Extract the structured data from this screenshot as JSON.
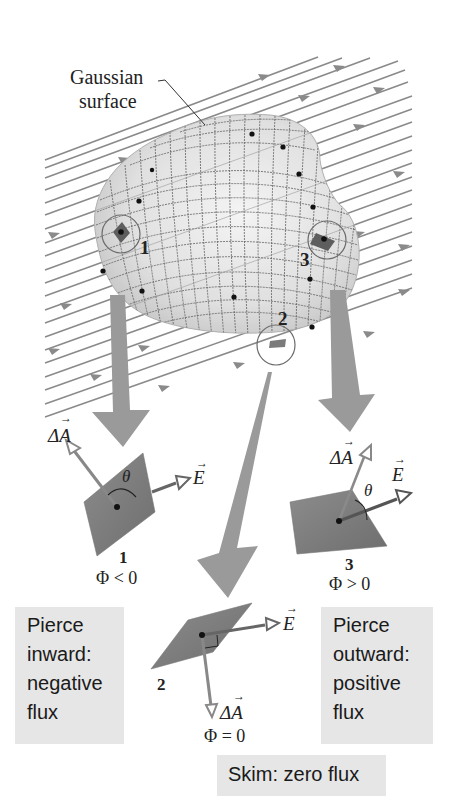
{
  "figure": {
    "surface_label": [
      "Gaussian",
      "surface"
    ],
    "region_labels": {
      "r1": "1",
      "r2": "2",
      "r3": "3"
    },
    "insets": [
      {
        "id": "1",
        "area_vector": "ΔA",
        "field_vector": "E",
        "angle": "θ",
        "flux": "Φ < 0"
      },
      {
        "id": "2",
        "area_vector": "ΔA",
        "field_vector": "E",
        "flux": "Φ = 0"
      },
      {
        "id": "3",
        "area_vector": "ΔA",
        "field_vector": "E",
        "angle": "θ",
        "flux": "Φ > 0"
      }
    ],
    "captions": {
      "inward": [
        "Pierce",
        "inward:",
        "negative",
        "flux"
      ],
      "outward": [
        "Pierce",
        "outward:",
        "positive",
        "flux"
      ],
      "skim": "Skim: zero flux"
    },
    "colors": {
      "field_lines": "#8a8a8a",
      "surface": "#e2e2e2",
      "grid": "#5a5a5a",
      "patch": "#7a7a7a",
      "big_arrow": "#9a9a9a",
      "caption_bg": "#e6e6e6"
    }
  }
}
